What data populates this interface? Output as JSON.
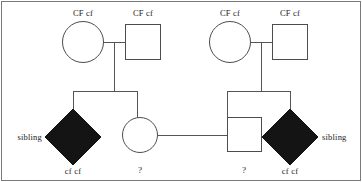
{
  "figure": {
    "type": "pedigree-chart",
    "trait": "cystic fibrosis",
    "border_color": "#7a7a7a",
    "line_color": "#555555",
    "shape_stroke": "#4d4d4d",
    "affected_fill": "#141414",
    "unaffected_fill": "#ffffff",
    "text_color": "#1a1a1a"
  },
  "generation1": {
    "left_couple": {
      "mother": {
        "shape": "circle",
        "sex": "female",
        "genotype": "CF cf",
        "affected": false
      },
      "father": {
        "shape": "square",
        "sex": "male",
        "genotype": "CF cf",
        "affected": false
      }
    },
    "right_couple": {
      "mother": {
        "shape": "circle",
        "sex": "female",
        "genotype": "CF cf",
        "affected": false
      },
      "father": {
        "shape": "square",
        "sex": "male",
        "genotype": "CF cf",
        "affected": false
      }
    }
  },
  "generation2": {
    "left_children": [
      {
        "shape": "diamond",
        "sex": "unspecified",
        "genotype": "cf cf",
        "affected": true,
        "side_label": "sibling"
      },
      {
        "shape": "circle",
        "sex": "female",
        "genotype": "?",
        "affected": false
      }
    ],
    "right_children": [
      {
        "shape": "square",
        "sex": "male",
        "genotype": "?",
        "affected": false
      },
      {
        "shape": "diamond",
        "sex": "unspecified",
        "genotype": "cf cf",
        "affected": true,
        "side_label": "sibling"
      }
    ]
  },
  "labels": {
    "g1_left_mother": "CF cf",
    "g1_left_father": "CF cf",
    "g1_right_mother": "CF cf",
    "g1_right_father": "CF cf",
    "g2_left_diamond_genotype": "cf cf",
    "g2_left_diamond_side": "sibling",
    "g2_left_circle_genotype": "?",
    "g2_right_square_genotype": "?",
    "g2_right_diamond_genotype": "cf cf",
    "g2_right_diamond_side": "sibling"
  }
}
